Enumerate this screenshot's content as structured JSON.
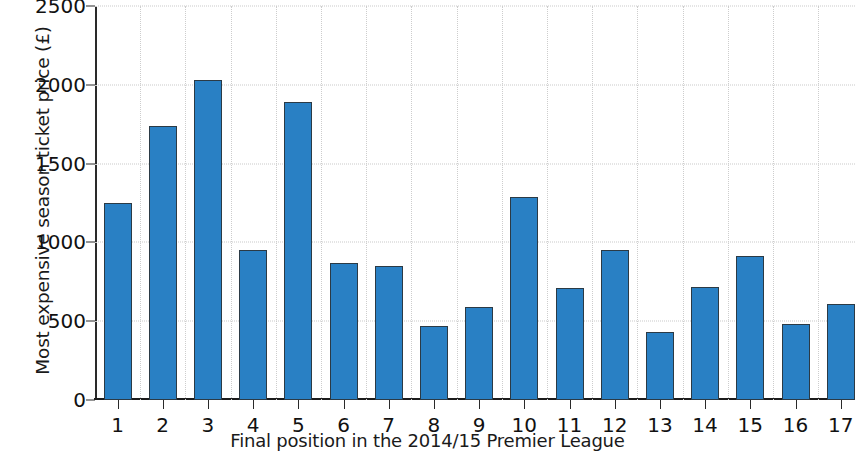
{
  "chart_data": {
    "type": "bar",
    "title": "",
    "xlabel": "Final position in the 2014/15 Premier League",
    "ylabel": "Most expensive season ticket price (£)",
    "categories": [
      "1",
      "2",
      "3",
      "4",
      "5",
      "6",
      "7",
      "8",
      "9",
      "10",
      "11",
      "12",
      "13",
      "14",
      "15",
      "16",
      "17"
    ],
    "values": [
      1250,
      1740,
      2030,
      950,
      1890,
      870,
      850,
      470,
      590,
      1290,
      710,
      955,
      430,
      720,
      915,
      485,
      610
    ],
    "ylim": [
      0,
      2500
    ],
    "yticks": [
      0,
      500,
      1000,
      1500,
      2000,
      2500
    ],
    "ytick_labels": [
      "0",
      "500",
      "1000",
      "1500",
      "2000",
      "2500"
    ],
    "xtick_labels": [
      "1",
      "2",
      "3",
      "4",
      "5",
      "6",
      "7",
      "8",
      "9",
      "10",
      "11",
      "12",
      "13",
      "14",
      "15",
      "16",
      "17"
    ],
    "grid": true,
    "legend": "none",
    "bar_color": "#2980c4",
    "bar_edge_color": "#2b3a45",
    "axis_color": "#1c1c1c",
    "grid_color": "#c9c9c9",
    "note": "Rightmost bar (position 17) is clipped by the image edge"
  }
}
